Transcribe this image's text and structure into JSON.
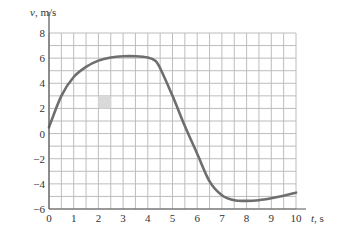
{
  "chart_data": {
    "type": "line",
    "title": "",
    "xlabel": "t, s",
    "ylabel": "v, m/s",
    "xlim": [
      0,
      10
    ],
    "ylim": [
      -6,
      8
    ],
    "xticks": [
      "0",
      "1",
      "2",
      "3",
      "4",
      "5",
      "6",
      "7",
      "8",
      "9",
      "10"
    ],
    "yticks": [
      "8",
      "6",
      "4",
      "2",
      "0",
      "−2",
      "−4",
      "−6"
    ],
    "grid": true,
    "grid_x_step": 0.5,
    "grid_y_step": 1,
    "series": [
      {
        "name": "v(t)",
        "x": [
          0,
          0.5,
          1,
          1.5,
          2,
          2.5,
          3,
          3.5,
          4,
          4.3,
          4.5,
          5,
          5.5,
          6,
          6.5,
          7,
          7.5,
          8,
          8.5,
          9,
          9.5,
          10
        ],
        "y": [
          0.5,
          3.0,
          4.5,
          5.3,
          5.8,
          6.05,
          6.15,
          6.15,
          6.05,
          5.8,
          5.2,
          3.0,
          0.6,
          -1.6,
          -3.8,
          -4.9,
          -5.3,
          -5.35,
          -5.3,
          -5.15,
          -4.95,
          -4.7
        ]
      }
    ],
    "annotations": [
      {
        "type": "shaded-cell",
        "x": [
          2,
          2.5
        ],
        "y": [
          2,
          3
        ]
      }
    ],
    "colors": {
      "line": "#6e6e6e",
      "grid": "#bdbdbd",
      "shade": "#d9d9d9"
    }
  }
}
